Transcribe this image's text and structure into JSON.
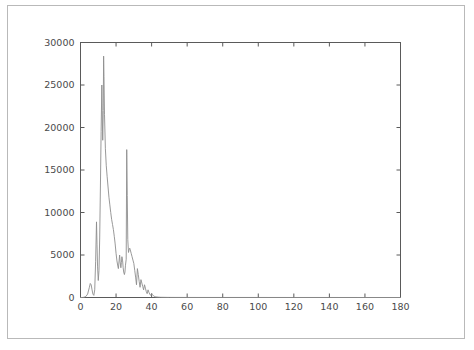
{
  "figure": {
    "background_color": "#ffffff",
    "border_color": "#b9b9b9",
    "axis_color": "#5a5a5a",
    "line_color": "#8d8d8d"
  },
  "chart_data": {
    "type": "line",
    "title": "",
    "xlabel": "",
    "ylabel": "",
    "xlim": [
      0,
      180
    ],
    "ylim": [
      0,
      30000
    ],
    "grid": false,
    "legend": null,
    "xticks": [
      0,
      20,
      40,
      60,
      80,
      100,
      120,
      140,
      160,
      180
    ],
    "xticklabels": [
      "0",
      "20",
      "40",
      "60",
      "80",
      "100",
      "120",
      "140",
      "160",
      "180"
    ],
    "yticks": [
      0,
      5000,
      10000,
      15000,
      20000,
      25000,
      30000
    ],
    "yticklabels": [
      "0",
      "5000",
      "10000",
      "15000",
      "20000",
      "25000",
      "30000"
    ],
    "series": [
      {
        "name": "distribution",
        "x": [
          0,
          1,
          2,
          3,
          4,
          5,
          5.5,
          6,
          6.5,
          7,
          7.5,
          8,
          8.5,
          9,
          9.3,
          9.6,
          10,
          10.4,
          10.8,
          11.2,
          11.6,
          12,
          12.2,
          12.5,
          12.8,
          13,
          13.2,
          13.5,
          14,
          14.5,
          15,
          15.5,
          16,
          16.5,
          17,
          17.5,
          18,
          18.5,
          19,
          19.5,
          20,
          20.5,
          21,
          21.3,
          21.7,
          22,
          22.3,
          22.7,
          23,
          23.3,
          23.7,
          24,
          24.3,
          24.7,
          25,
          25.3,
          25.7,
          26,
          26.3,
          26.6,
          27,
          27.3,
          27.7,
          28,
          28.5,
          29,
          29.5,
          30,
          30.5,
          31,
          31.5,
          32,
          32.5,
          33,
          33.5,
          34,
          34.5,
          35,
          35.5,
          36,
          36.5,
          37,
          37.5,
          38,
          38.5,
          39,
          39.5,
          40,
          40.5,
          41,
          41.5,
          42,
          43,
          44,
          45,
          50,
          60,
          80,
          100,
          120,
          140,
          160,
          180
        ],
        "y": [
          0,
          0,
          30,
          120,
          400,
          1200,
          1650,
          1500,
          900,
          400,
          250,
          900,
          4200,
          8900,
          6200,
          3600,
          2000,
          3200,
          7000,
          13000,
          19500,
          25000,
          22000,
          18500,
          22000,
          28400,
          26000,
          21500,
          17500,
          15500,
          14200,
          13000,
          11800,
          10900,
          10000,
          9200,
          8600,
          8000,
          7200,
          6300,
          5200,
          4300,
          3700,
          3400,
          4300,
          5000,
          4200,
          3500,
          4100,
          4800,
          4300,
          3500,
          3000,
          2700,
          3000,
          3800,
          4500,
          17400,
          12000,
          6800,
          5300,
          5600,
          5800,
          5600,
          5200,
          4800,
          4400,
          4000,
          3200,
          2400,
          1500,
          3400,
          2700,
          1900,
          1200,
          2100,
          1700,
          1300,
          900,
          1500,
          1100,
          700,
          450,
          900,
          600,
          380,
          250,
          500,
          330,
          210,
          140,
          90,
          60,
          40,
          25,
          10,
          5,
          3,
          2,
          1,
          1,
          0,
          0
        ]
      }
    ]
  }
}
